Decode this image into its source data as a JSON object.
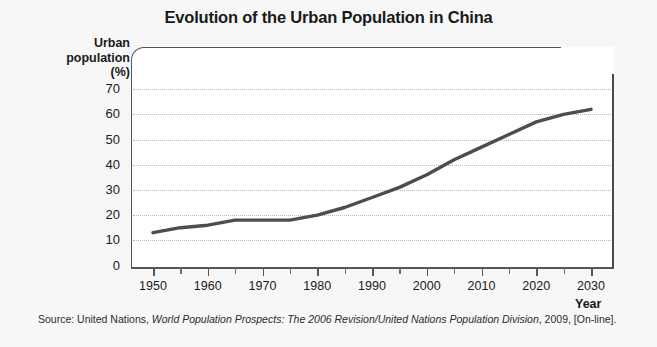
{
  "chart_data": {
    "type": "line",
    "title": "Evolution of the Urban Population in China",
    "xlabel": "Year",
    "ylabel": "Urban population (%)",
    "ylabel_lines": [
      "Urban",
      "population",
      "(%)"
    ],
    "xlim": [
      1950,
      2035
    ],
    "ylim": [
      0,
      75
    ],
    "grid": true,
    "legend": "none",
    "yticks": [
      70,
      60,
      50,
      40,
      30,
      20,
      10,
      0
    ],
    "xticks": [
      1950,
      1960,
      1970,
      1980,
      1990,
      2000,
      2010,
      2020,
      2030
    ],
    "xticks_minor": [
      1955,
      1965,
      1975,
      1985,
      1995,
      2005,
      2015,
      2025
    ],
    "series": [
      {
        "name": "Urban population of China",
        "color": "#4d4d4d",
        "x": [
          1950,
          1955,
          1960,
          1965,
          1970,
          1975,
          1980,
          1985,
          1990,
          1995,
          2000,
          2005,
          2010,
          2015,
          2020,
          2025,
          2030
        ],
        "values": [
          13,
          15,
          16,
          18,
          18,
          18,
          20,
          23,
          27,
          31,
          36,
          42,
          47,
          52,
          57,
          60,
          62
        ]
      }
    ],
    "source": {
      "prefix": "Source: United Nations, ",
      "italic": "World Population Prospects: The 2006 Revision/United Nations Population Division",
      "suffix": ", 2009, [On-line]."
    }
  }
}
